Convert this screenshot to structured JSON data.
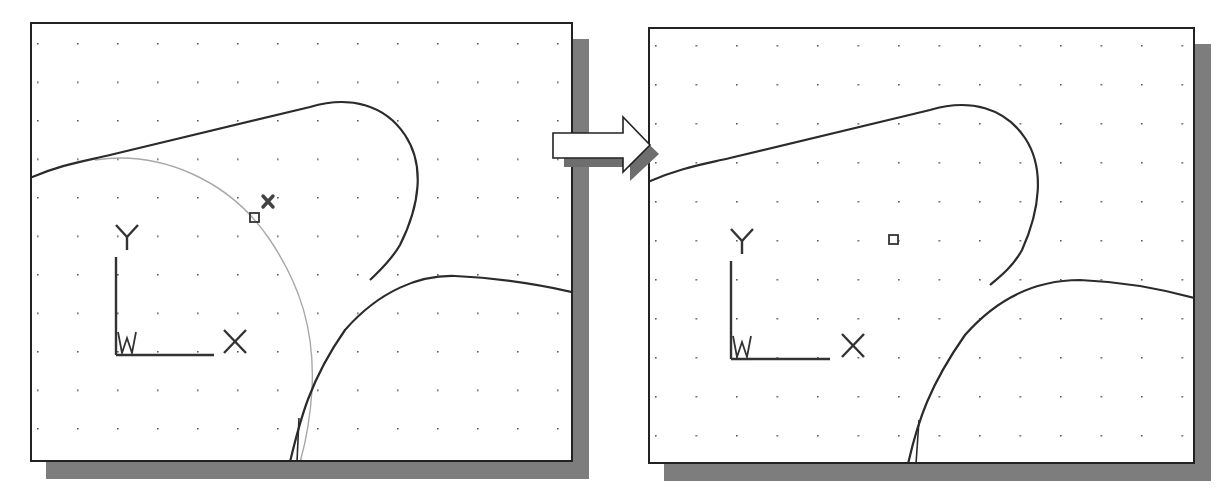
{
  "figure": {
    "colors": {
      "geometry": "#2b2b2b",
      "construction_circle": "#a8a8a8",
      "shadow": "#7d7d7d",
      "grid_dot": "#555555",
      "frame": "#222222"
    }
  },
  "left_panel": {
    "ucs": {
      "y_label": "Y",
      "x_label": "X",
      "w_label": "W"
    },
    "markers": [
      "snap-box",
      "pick-cross"
    ]
  },
  "right_panel": {
    "ucs": {
      "y_label": "Y",
      "x_label": "X",
      "w_label": "W"
    },
    "markers": [
      "snap-box"
    ]
  },
  "arrow": {
    "direction": "right"
  }
}
